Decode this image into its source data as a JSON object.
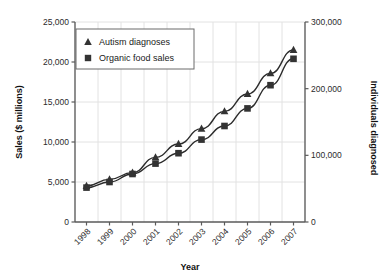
{
  "chart_data": {
    "type": "line",
    "title": "",
    "xlabel": "Year",
    "ylabel": "Sales ($ millions)",
    "y2label": "Individuals diagnosed",
    "categories": [
      "1998",
      "1999",
      "2000",
      "2001",
      "2002",
      "2003",
      "2004",
      "2005",
      "2006",
      "2007"
    ],
    "x": [
      1998,
      1999,
      2000,
      2001,
      2002,
      2003,
      2004,
      2005,
      2006,
      2007
    ],
    "ylim": [
      0,
      25000
    ],
    "y2lim": [
      0,
      300000
    ],
    "yticks": [
      "0",
      "5,000",
      "10,000",
      "15,000",
      "20,000",
      "25,000"
    ],
    "ytick_values": [
      0,
      5000,
      10000,
      15000,
      20000,
      25000
    ],
    "y2ticks": [
      "0",
      "100,000",
      "200,000",
      "300,000"
    ],
    "y2tick_values": [
      0,
      100000,
      200000,
      300000
    ],
    "grid": true,
    "legend_position": "upper-left",
    "series": [
      {
        "name": "Autism diagnoses",
        "marker": "triangle",
        "axis": "right",
        "values": [
          54000,
          64000,
          74000,
          97000,
          117000,
          140000,
          166000,
          192000,
          223000,
          258000
        ]
      },
      {
        "name": "Organic food sales",
        "marker": "square",
        "axis": "left",
        "values": [
          4300,
          5000,
          6000,
          7300,
          8600,
          10300,
          12000,
          14200,
          17100,
          20400
        ]
      }
    ],
    "colors": {
      "series_line": "#2b2b2b",
      "marker": "#333333",
      "axis": "#5a5a5a",
      "grid": "#e2e2e2",
      "text": "#1a1a1a",
      "background": "#ffffff"
    }
  },
  "legend": {
    "items": [
      {
        "label": "Autism diagnoses",
        "marker": "triangle-marker"
      },
      {
        "label": "Organic food sales",
        "marker": "square-marker"
      }
    ]
  },
  "axes": {
    "left_title": "Sales ($ millions)",
    "right_title": "Individuals diagnosed",
    "bottom_title": "Year"
  }
}
